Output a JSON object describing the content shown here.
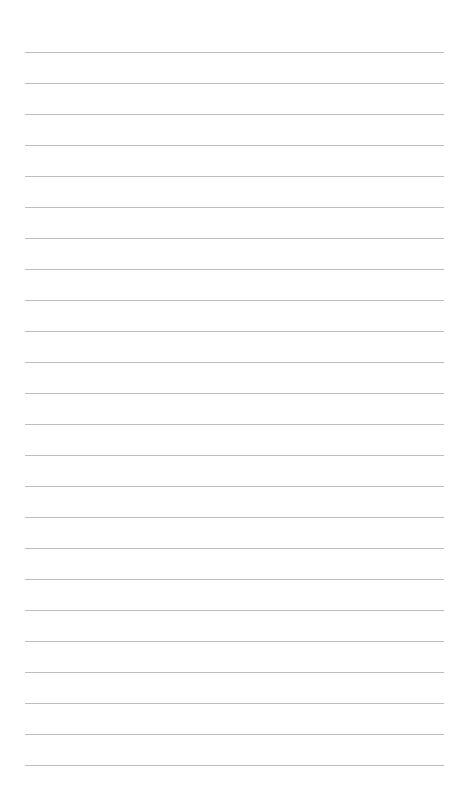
{
  "page": {
    "type": "lined-paper",
    "background_color": "#ffffff",
    "line_color": "#bdbdbd",
    "line_count": 24,
    "first_line_y": 52,
    "line_spacing": 31,
    "line_left": 25,
    "line_width": 419
  }
}
